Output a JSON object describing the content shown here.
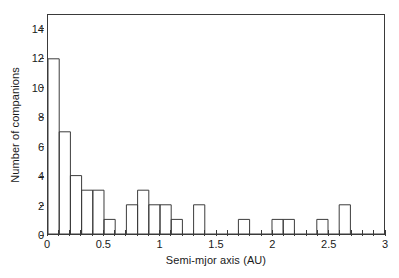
{
  "chart_data": {
    "type": "bar",
    "title": "",
    "subtitle": "",
    "xlabel": "Semi-mjor axis (AU)",
    "ylabel": "Number of companions",
    "xlim": [
      0,
      3
    ],
    "ylim": [
      0,
      15
    ],
    "grid": false,
    "legend": null,
    "bin_width": 0.1,
    "bin_left_edges": [
      0.0,
      0.1,
      0.2,
      0.3,
      0.4,
      0.5,
      0.6,
      0.7,
      0.8,
      0.9,
      1.0,
      1.1,
      1.2,
      1.3,
      1.4,
      1.5,
      1.6,
      1.7,
      1.8,
      1.9,
      2.0,
      2.1,
      2.2,
      2.3,
      2.4,
      2.5,
      2.6,
      2.7,
      2.8,
      2.9
    ],
    "values": [
      12,
      7,
      4,
      3,
      3,
      1,
      0,
      2,
      3,
      2,
      2,
      1,
      0,
      2,
      0,
      0,
      0,
      1,
      0,
      0,
      1,
      1,
      0,
      0,
      1,
      0,
      2,
      0,
      0,
      0
    ],
    "categories": [
      "0.0-0.1",
      "0.1-0.2",
      "0.2-0.3",
      "0.3-0.4",
      "0.4-0.5",
      "0.5-0.6",
      "0.6-0.7",
      "0.7-0.8",
      "0.8-0.9",
      "0.9-1.0",
      "1.0-1.1",
      "1.1-1.2",
      "1.2-1.3",
      "1.3-1.4",
      "1.4-1.5",
      "1.5-1.6",
      "1.6-1.7",
      "1.7-1.8",
      "1.8-1.9",
      "1.9-2.0",
      "2.0-2.1",
      "2.1-2.2",
      "2.2-2.3",
      "2.3-2.4",
      "2.4-2.5",
      "2.5-2.6",
      "2.6-2.7",
      "2.7-2.8",
      "2.8-2.9",
      "2.9-3.0"
    ],
    "xticks": [
      0,
      0.5,
      1,
      1.5,
      2,
      2.5,
      3
    ],
    "xticklabels": [
      "0",
      "0.5",
      "1",
      "1.5",
      "2",
      "2.5",
      "3"
    ],
    "yticks": [
      0,
      2,
      4,
      6,
      8,
      10,
      12,
      14
    ],
    "yticklabels": [
      "0",
      "2",
      "4",
      "6",
      "8",
      "10",
      "12",
      "14"
    ],
    "x_minor_tick_step": 0.1,
    "bar_edge_color": "#3a3a3a",
    "bar_fill_color": "#ffffff",
    "axis_color": "#3a3a3a",
    "background_color": "#ffffff"
  }
}
